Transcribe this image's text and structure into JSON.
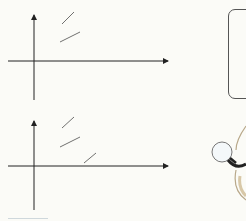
{
  "figure_top": {
    "y_label": "v",
    "x_label": "t",
    "origin_label": "0",
    "curves": [
      {
        "name": "v",
        "subscript": "1",
        "relative_amplitude": 1.0,
        "phase_deg": 0
      },
      {
        "name": "v",
        "subscript": "2",
        "relative_amplitude": 0.52,
        "phase_deg": 0
      }
    ]
  },
  "figure_bottom": {
    "y_label": "i",
    "x_label": "t",
    "origin_label": "0",
    "curves": [
      {
        "name": "i",
        "subscript": "2",
        "relative_amplitude": 1.0,
        "phase_deg": 0
      },
      {
        "name": "i",
        "subscript": "1",
        "relative_amplitude": 0.5,
        "phase_deg": 0
      },
      {
        "name": "i",
        "subscript": "0",
        "relative_amplitude": 0.07,
        "phase_deg": -90
      }
    ]
  },
  "side_note": {
    "line1": "2",
    "line2": "え",
    "line3_var": "v",
    "line3_sub": "1",
    "line4_var": "i",
    "line4_sub": "0",
    "line5": "90"
  },
  "colors": {
    "ink": "#333333",
    "paper": "#fbfbf7"
  }
}
